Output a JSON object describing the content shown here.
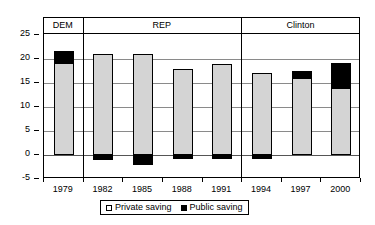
{
  "chart_data": {
    "type": "bar",
    "title": "",
    "subtitle": "",
    "xlabel": "",
    "ylabel": "",
    "categories": [
      "1979",
      "1982",
      "1985",
      "1988",
      "1991",
      "1994",
      "1997",
      "2000"
    ],
    "ylim": [
      -5,
      25
    ],
    "yticks": [
      -5,
      0,
      5,
      10,
      15,
      20,
      25
    ],
    "ytick_labels": [
      "-5",
      "0",
      "5",
      "10",
      "15",
      "20",
      "25"
    ],
    "grid": true,
    "stacked": true,
    "legend_position": "bottom",
    "series": [
      {
        "name": "Private saving",
        "color": "#d4d4d4",
        "values": [
          19.1,
          21.0,
          21.0,
          18.0,
          19.0,
          17.0,
          16.0,
          14.0
        ]
      },
      {
        "name": "Public saving",
        "color": "#000000",
        "values": [
          2.5,
          -1.0,
          -2.0,
          -0.8,
          -0.9,
          -0.9,
          1.5,
          5.2
        ]
      }
    ],
    "totals": [
      21.6,
      21.0,
      21.0,
      18.0,
      19.0,
      17.0,
      17.5,
      19.2
    ],
    "regions": [
      {
        "label": "DEM",
        "start_index": 0,
        "end_index": 0
      },
      {
        "label": "REP",
        "start_index": 1,
        "end_index": 4
      },
      {
        "label": "Clinton",
        "start_index": 5,
        "end_index": 7
      }
    ]
  },
  "legend": {
    "items": [
      {
        "label": "Private saving",
        "swatch": "private-swatch-icon"
      },
      {
        "label": "Public saving",
        "swatch": "public-swatch-icon"
      }
    ]
  }
}
